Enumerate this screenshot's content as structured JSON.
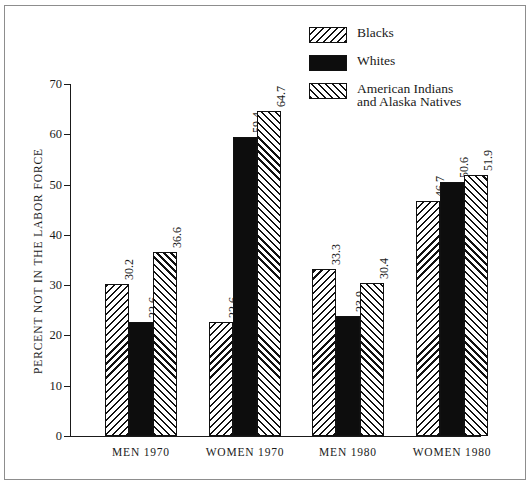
{
  "chart_data": {
    "type": "bar",
    "title": "",
    "xlabel": "",
    "ylabel": "PERCENT NOT IN THE LABOR FORCE",
    "ylim": [
      0,
      70
    ],
    "yticks": [
      0,
      10,
      20,
      30,
      40,
      50,
      60,
      70
    ],
    "ytick_labels": [
      "0",
      "10",
      "20",
      "30",
      "40",
      "50",
      "60",
      "70"
    ],
    "grid": false,
    "legend_position": "top-right",
    "categories": [
      "MEN 1970",
      "WOMEN 1970",
      "MEN 1980",
      "WOMEN 1980"
    ],
    "series": [
      {
        "name": "Blacks",
        "pattern": "hatch-backslash",
        "values": [
          30.2,
          22.6,
          33.3,
          46.7
        ],
        "value_labels": [
          "30.2",
          "22.6",
          "33.3",
          "46.7"
        ]
      },
      {
        "name": "Whites",
        "pattern": "solid-black",
        "values": [
          22.6,
          59.4,
          23.9,
          50.6
        ],
        "value_labels": [
          "22.6",
          "59.4",
          "23.9",
          "50.6"
        ]
      },
      {
        "name": "American Indians and Alaska Natives",
        "pattern": "hatch-forwardslash",
        "values": [
          36.6,
          64.7,
          30.4,
          51.9
        ],
        "value_labels": [
          "36.6",
          "64.7",
          "30.4",
          "51.9"
        ]
      }
    ],
    "bars": [
      {
        "group": "MEN 1970",
        "series": "Blacks",
        "value": 30.2,
        "label": "30.2"
      },
      {
        "group": "MEN 1970",
        "series": "Whites",
        "value": 22.6,
        "label": "22.6"
      },
      {
        "group": "MEN 1970",
        "series": "American Indians and Alaska Natives",
        "value": 36.6,
        "label": "36.6"
      },
      {
        "group": "WOMEN 1970",
        "series": "Blacks",
        "value": 52.6,
        "label": "52.6"
      },
      {
        "group": "WOMEN 1970",
        "series": "Whites",
        "value": 59.4,
        "label": "59.4"
      },
      {
        "group": "WOMEN 1970",
        "series": "American Indians and Alaska Natives",
        "value": 64.7,
        "label": "64.7"
      },
      {
        "group": "MEN 1980",
        "series": "Blacks",
        "value": 33.3,
        "label": "33.3"
      },
      {
        "group": "MEN 1980",
        "series": "Whites",
        "value": 23.9,
        "label": "23.9"
      },
      {
        "group": "MEN 1980",
        "series": "American Indians and Alaska Natives",
        "value": 30.4,
        "label": "30.4"
      },
      {
        "group": "WOMEN 1980",
        "series": "Blacks",
        "value": 46.7,
        "label": "46.7"
      },
      {
        "group": "WOMEN 1980",
        "series": "Whites",
        "value": 50.6,
        "label": "50.6"
      },
      {
        "group": "WOMEN 1980",
        "series": "American Indians and Alaska Natives",
        "value": 51.9,
        "label": "51.9"
      }
    ],
    "colors": {
      "ink": "#111111",
      "background": "#ffffff",
      "frame": "#8d8d8d"
    }
  },
  "legend": {
    "entries": [
      {
        "label": "Blacks",
        "line2": ""
      },
      {
        "label": "Whites",
        "line2": ""
      },
      {
        "label": "American Indians",
        "line2": "and Alaska Natives"
      }
    ]
  },
  "axes": {
    "y_title": "PERCENT NOT IN THE LABOR FORCE",
    "y_tick_labels": [
      "70",
      "60",
      "50",
      "40",
      "30",
      "20",
      "10",
      "0"
    ],
    "x_categories": [
      "MEN 1970",
      "WOMEN 1970",
      "MEN 1980",
      "WOMEN 1980"
    ]
  }
}
